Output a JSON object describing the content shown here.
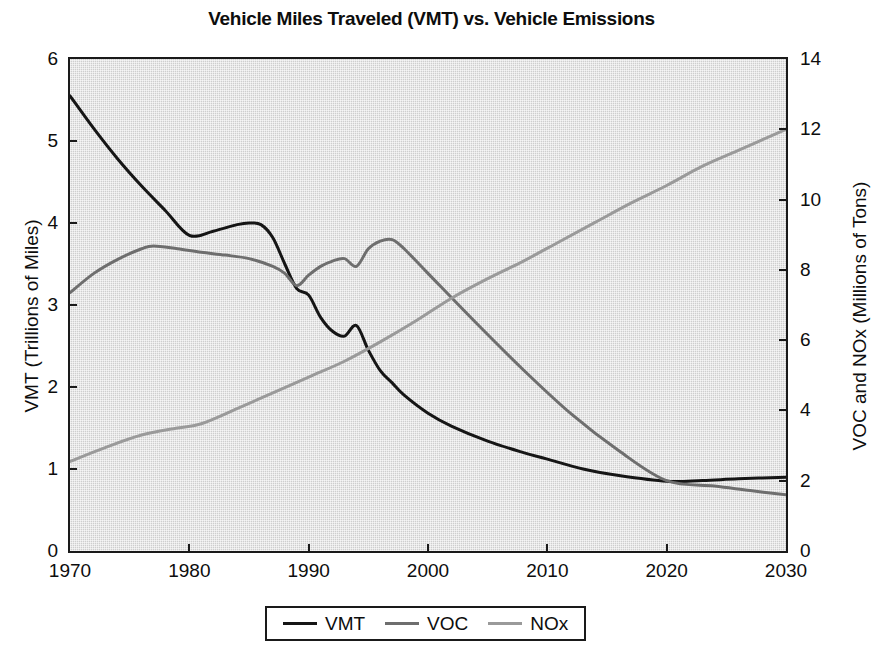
{
  "chart_data": {
    "type": "line",
    "title": "Vehicle Miles Traveled (VMT) vs. Vehicle Emissions",
    "xlabel": "",
    "ylabel": "VMT (Trillions of Miles)",
    "ylabel_right": "VOC and NOx (Millions of Tons)",
    "xlim": [
      1970,
      2030
    ],
    "ylim": [
      0,
      6
    ],
    "ylim_right": [
      0,
      14
    ],
    "xticks": [
      "1970",
      "1980",
      "1990",
      "2000",
      "2010",
      "2020",
      "2030"
    ],
    "yticks_left": [
      "0",
      "1",
      "2",
      "3",
      "4",
      "5",
      "6"
    ],
    "yticks_right": [
      "0",
      "2",
      "4",
      "6",
      "8",
      "10",
      "12",
      "14"
    ],
    "grid": false,
    "legend_position": "bottom",
    "series": [
      {
        "name": "VMT",
        "axis": "left",
        "color": "#151515",
        "x": [
          1970,
          1972,
          1974,
          1976,
          1978,
          1980,
          1982,
          1984,
          1985,
          1986,
          1987,
          1988,
          1989,
          1990,
          1991,
          1992,
          1993,
          1994,
          1995,
          1996,
          1997,
          1998,
          2000,
          2002,
          2005,
          2008,
          2010,
          2013,
          2016,
          2020,
          2023,
          2026,
          2030
        ],
        "y": [
          5.55,
          5.15,
          4.78,
          4.45,
          4.15,
          3.85,
          3.9,
          3.98,
          4.0,
          3.98,
          3.82,
          3.5,
          3.2,
          3.12,
          2.85,
          2.68,
          2.62,
          2.75,
          2.45,
          2.2,
          2.05,
          1.9,
          1.68,
          1.52,
          1.34,
          1.2,
          1.12,
          1.0,
          0.92,
          0.85,
          0.86,
          0.88,
          0.9
        ]
      },
      {
        "name": "VOC",
        "axis": "right",
        "color": "#6e6e6e",
        "x": [
          1970,
          1972,
          1974,
          1976,
          1977,
          1979,
          1981,
          1983,
          1985,
          1987,
          1988,
          1989,
          1990,
          1991,
          1992,
          1993,
          1994,
          1995,
          1996,
          1997,
          1998,
          2000,
          2004,
          2008,
          2012,
          2016,
          2020,
          2024,
          2027,
          2030
        ],
        "y": [
          7.35,
          7.9,
          8.3,
          8.6,
          8.68,
          8.6,
          8.5,
          8.42,
          8.32,
          8.1,
          7.9,
          7.55,
          7.85,
          8.1,
          8.25,
          8.32,
          8.1,
          8.6,
          8.82,
          8.86,
          8.6,
          7.9,
          6.5,
          5.15,
          3.9,
          2.85,
          2.0,
          1.85,
          1.72,
          1.6
        ]
      },
      {
        "name": "NOx",
        "axis": "right",
        "color": "#9a9a9a",
        "x": [
          1970,
          1973,
          1976,
          1979,
          1981,
          1984,
          1987,
          1990,
          1993,
          1996,
          1999,
          2002,
          2005,
          2008,
          2011,
          2014,
          2017,
          2020,
          2023,
          2026,
          2030
        ],
        "y": [
          2.55,
          2.95,
          3.3,
          3.5,
          3.62,
          4.05,
          4.5,
          4.95,
          5.4,
          5.95,
          6.55,
          7.2,
          7.75,
          8.25,
          8.8,
          9.35,
          9.9,
          10.4,
          10.95,
          11.4,
          12.0
        ]
      }
    ]
  },
  "legend": {
    "items": [
      {
        "label": "VMT",
        "color": "#151515"
      },
      {
        "label": "VOC",
        "color": "#6e6e6e"
      },
      {
        "label": "NOx",
        "color": "#9a9a9a"
      }
    ]
  }
}
